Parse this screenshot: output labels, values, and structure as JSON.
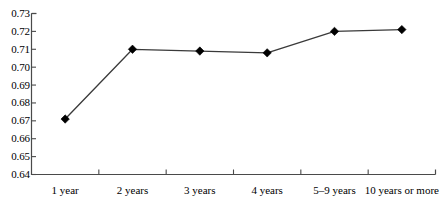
{
  "chart_data": {
    "type": "line",
    "title": "",
    "subtitle": "",
    "xlabel": "",
    "ylabel": "",
    "categories": [
      "1 year",
      "2 years",
      "3 years",
      "4 years",
      "5–9 years",
      "10 years or more"
    ],
    "values": [
      0.671,
      0.71,
      0.709,
      0.708,
      0.72,
      0.721
    ],
    "series": [
      {
        "name": "",
        "values": [
          0.671,
          0.71,
          0.709,
          0.708,
          0.72,
          0.721
        ]
      }
    ],
    "ylim": [
      0.64,
      0.73
    ],
    "ytick_step": 0.01,
    "ytick_labels": [
      "0.73",
      "0.72",
      "0.71",
      "0.70",
      "0.69",
      "0.68",
      "0.67",
      "0.66",
      "0.65",
      "0.64"
    ],
    "ytick_values": [
      0.73,
      0.72,
      0.71,
      0.7,
      0.69,
      0.68,
      0.67,
      0.66,
      0.65,
      0.64
    ],
    "grid": false,
    "legend": "none",
    "marker": "diamond",
    "marker_color": "#000000",
    "line_color": "#3a3a3a",
    "axis_color": "#4a4a4a",
    "background": "#ffffff"
  }
}
